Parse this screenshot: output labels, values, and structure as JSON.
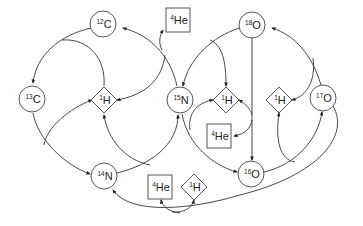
{
  "diagram": {
    "nodes": [
      {
        "id": "c12",
        "shape": "circle",
        "mass": "12",
        "symbol": "C",
        "x": 103,
        "y": 24
      },
      {
        "id": "c13",
        "shape": "circle",
        "mass": "13",
        "symbol": "C",
        "x": 32,
        "y": 99
      },
      {
        "id": "n14",
        "shape": "circle",
        "mass": "14",
        "symbol": "N",
        "x": 104,
        "y": 176
      },
      {
        "id": "n15",
        "shape": "circle",
        "mass": "15",
        "symbol": "N",
        "x": 180,
        "y": 100
      },
      {
        "id": "o16",
        "shape": "circle",
        "mass": "16",
        "symbol": "O",
        "x": 251,
        "y": 174
      },
      {
        "id": "o17",
        "shape": "circle",
        "mass": "17",
        "symbol": "O",
        "x": 323,
        "y": 98
      },
      {
        "id": "o18",
        "shape": "circle",
        "mass": "18",
        "symbol": "O",
        "x": 252,
        "y": 25
      },
      {
        "id": "h1_left",
        "shape": "diamond",
        "mass": "1",
        "symbol": "H",
        "x": 104,
        "y": 100
      },
      {
        "id": "h1_center",
        "shape": "diamond",
        "mass": "1",
        "symbol": "H",
        "x": 226,
        "y": 100
      },
      {
        "id": "h1_right",
        "shape": "diamond",
        "mass": "1",
        "symbol": "H",
        "x": 279,
        "y": 100
      },
      {
        "id": "h1_bottom",
        "shape": "diamond",
        "mass": "1",
        "symbol": "H",
        "x": 194,
        "y": 187
      },
      {
        "id": "he4_top",
        "shape": "box",
        "mass": "4",
        "symbol": "He",
        "x": 178,
        "y": 20
      },
      {
        "id": "he4_middle",
        "shape": "box",
        "mass": "4",
        "symbol": "He",
        "x": 219,
        "y": 136
      },
      {
        "id": "he4_bottom",
        "shape": "box",
        "mass": "4",
        "symbol": "He",
        "x": 160,
        "y": 187
      }
    ],
    "edges": [
      {
        "from": "c12",
        "to": "c13",
        "via": "h1_left"
      },
      {
        "from": "c13",
        "to": "n14",
        "via": "h1_left"
      },
      {
        "from": "n14",
        "to": "n15",
        "via": "h1_left"
      },
      {
        "from": "n15",
        "to": "c12",
        "via": "h1_left",
        "emits": "he4_top"
      },
      {
        "from": "n15",
        "to": "o16",
        "via": "h1_center"
      },
      {
        "from": "o18",
        "to": "n15",
        "via": "h1_center"
      },
      {
        "from": "o18",
        "to": "o16",
        "emits": "he4_middle"
      },
      {
        "from": "o16",
        "to": "o17",
        "via": "h1_right"
      },
      {
        "from": "o17",
        "to": "o18",
        "via": "h1_right"
      },
      {
        "from": "o17",
        "to": "n14",
        "via": "h1_bottom",
        "emits": "he4_bottom"
      }
    ]
  }
}
